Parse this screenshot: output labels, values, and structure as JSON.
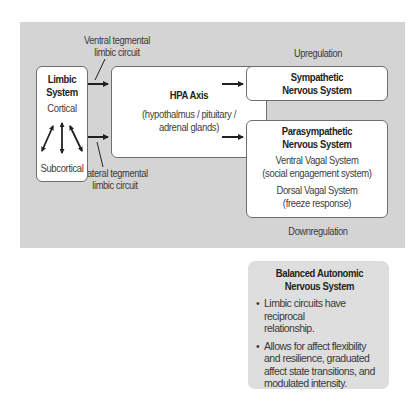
{
  "panel": {
    "upregulation_label": "Upregulation",
    "downregulation_label": "Downregulation",
    "ventral_circuit_label": [
      "Ventral tegmental",
      "limbic circuit"
    ],
    "lateral_circuit_label": [
      "Lateral tegmental",
      "limbic circuit"
    ]
  },
  "limbic": {
    "title": [
      "Limbic",
      "System"
    ],
    "top_label": "Cortical",
    "bottom_label": "Subcortical"
  },
  "hpa": {
    "title": "HPA Axis",
    "description": [
      "(hypothalmus / pituitary /",
      "adrenal glands)"
    ]
  },
  "sympathetic": {
    "title": [
      "Sympathetic",
      "Nervous System"
    ]
  },
  "parasympathetic": {
    "title": [
      "Parasympathetic",
      "Nervous System"
    ],
    "ventral": [
      "Ventral Vagal System",
      "(social engagement system)"
    ],
    "dorsal": [
      "Dorsal Vagal System",
      "(freeze response)"
    ]
  },
  "balanced": {
    "title": [
      "Balanced Autonomic",
      "Nervous System"
    ],
    "bullet_glyph": "•",
    "bullets": [
      [
        "Limbic circuits have reciprocal",
        "relationship."
      ],
      [
        "Allows for affect flexibility",
        "and resilience, graduated",
        "affect state transitions, and",
        "modulated intensity."
      ]
    ]
  },
  "colors": {
    "panel_bg": "#d4d4d4",
    "box_bg": "#ffffff",
    "border": "#6d6e71",
    "arrow": "#231f20",
    "balanced_bg": "#dedede"
  }
}
